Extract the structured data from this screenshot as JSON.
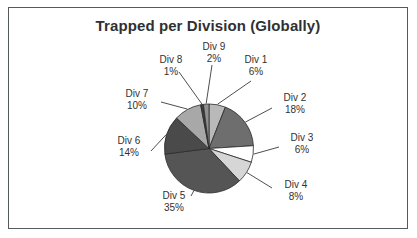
{
  "chart": {
    "title": "Trapped per Division (Globally)",
    "frame_color": "#555a5d",
    "title_color": "#2f3133",
    "label_color": "#2f3133"
  },
  "chart_data": {
    "type": "pie",
    "title": "Trapped per Division (Globally)",
    "xlabel": "",
    "ylabel": "",
    "legend": "none",
    "grid": false,
    "start_angle_deg": 0,
    "direction": "clockwise",
    "categories": [
      "Div 1",
      "Div 2",
      "Div 3",
      "Div 4",
      "Div 5",
      "Div 6",
      "Div 7",
      "Div 8",
      "Div 9"
    ],
    "values": [
      6,
      18,
      6,
      8,
      35,
      14,
      10,
      1,
      2
    ],
    "value_labels": [
      "6%",
      "18%",
      "6%",
      "8%",
      "35%",
      "14%",
      "10%",
      "1%",
      "2%"
    ],
    "units": "percent",
    "total": 100,
    "colors": [
      "#b9b9b9",
      "#6e6e6e",
      "#ffffff",
      "#d6d6d6",
      "#555555",
      "#4a4a4a",
      "#a8a8a8",
      "#3d3d3d",
      "#909090"
    ],
    "slices": [
      {
        "name": "Div 1",
        "value": 6,
        "label": "Div 1",
        "pct": "6%",
        "color": "#b9b9b9"
      },
      {
        "name": "Div 2",
        "value": 18,
        "label": "Div 2",
        "pct": "18%",
        "color": "#6e6e6e"
      },
      {
        "name": "Div 3",
        "value": 6,
        "label": "Div 3",
        "pct": "6%",
        "color": "#ffffff"
      },
      {
        "name": "Div 4",
        "value": 8,
        "label": "Div 4",
        "pct": "8%",
        "color": "#d6d6d6"
      },
      {
        "name": "Div 5",
        "value": 35,
        "label": "Div 5",
        "pct": "35%",
        "color": "#555555"
      },
      {
        "name": "Div 6",
        "value": 14,
        "label": "Div 6",
        "pct": "14%",
        "color": "#4a4a4a"
      },
      {
        "name": "Div 7",
        "value": 10,
        "label": "Div 7",
        "pct": "10%",
        "color": "#a8a8a8"
      },
      {
        "name": "Div 8",
        "value": 1,
        "label": "Div 8",
        "pct": "1%",
        "color": "#3d3d3d"
      },
      {
        "name": "Div 9",
        "value": 2,
        "label": "Div 9",
        "pct": "2%",
        "color": "#909090"
      }
    ]
  }
}
